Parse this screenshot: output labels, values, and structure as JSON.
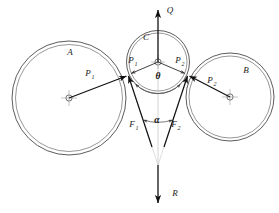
{
  "figure": {
    "background_color": "#ffffff",
    "line_color": "#3c3c3c",
    "vector_color": "#111111",
    "labels": {
      "circle_a": "A",
      "circle_b": "B",
      "circle_c": "C",
      "force_p1_left": "P",
      "force_p1_left_sub": "1",
      "force_p2_right": "P",
      "force_p2_right_sub": "2",
      "reaction_p1_center": "P",
      "reaction_p1_center_sub": "1",
      "reaction_p2_center": "P",
      "reaction_p2_center_sub": "2",
      "force_f1": "F",
      "force_f1_sub": "1",
      "force_f2": "F",
      "force_f2_sub": "2",
      "angle_theta": "θ",
      "angle_alpha": "α",
      "load_q": "Q",
      "reaction_r": "R"
    },
    "geometry": {
      "circle_a": {
        "cx": 69,
        "cy": 98,
        "r_outer": 57,
        "r_inner": 53.5
      },
      "circle_b": {
        "cx": 230,
        "cy": 97,
        "r_outer": 44,
        "r_inner": 41
      },
      "circle_c": {
        "cx": 158,
        "cy": 62,
        "r_outer": 31.5,
        "r_inner": 29
      },
      "contact_left": {
        "x": 128,
        "y": 75
      },
      "contact_right": {
        "x": 188,
        "y": 75
      },
      "apex": {
        "x": 158,
        "y": 165
      },
      "q_arrow_tip": {
        "x": 158,
        "y": 8
      },
      "r_arrow_tip": {
        "x": 158,
        "y": 205
      }
    }
  }
}
